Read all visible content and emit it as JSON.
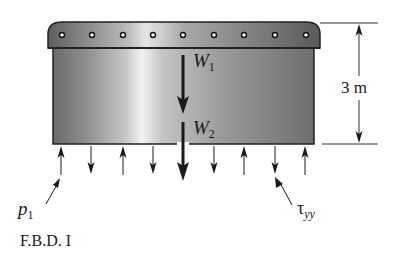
{
  "figure": {
    "caption": "F.B.D. I",
    "labels": {
      "w1": {
        "main": "W",
        "sub": "1"
      },
      "w2": {
        "main": "W",
        "sub": "2"
      },
      "height_dimension": "3 m",
      "p1": {
        "main": "p",
        "sub": "1"
      },
      "tau": {
        "main": "τ",
        "sub": "yy"
      }
    },
    "rivet_count": 9,
    "bottom_arrows": [
      "up",
      "down",
      "up",
      "down",
      "down",
      "up",
      "down",
      "up"
    ],
    "colors": {
      "body_dark": "#6e6e6e",
      "body_light": "#e8e8e8",
      "lid": "#8a8a8a",
      "outline": "#222222",
      "arrow": "#1a1a1a"
    }
  }
}
